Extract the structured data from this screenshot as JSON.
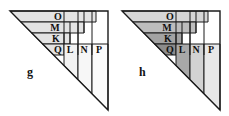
{
  "figure": {
    "title_visible": false,
    "background_color": "#ffffff",
    "stroke_color": "#1a1a1a",
    "panels": [
      {
        "id": "g",
        "panel_label": "g",
        "panel_label_x": 27,
        "panel_label_y": 66,
        "shaded": false,
        "triangle": {
          "apex_left_x": 10,
          "apex_top_y": 11,
          "corner_right_x": 108,
          "corner_bottom_y": 110
        },
        "bands": [
          {
            "label": "O",
            "y_top": 11,
            "y_bottom": 22,
            "x_right": 96,
            "fill": "#e3e3e3",
            "label_x": 58,
            "label_y": 20
          },
          {
            "label": "M",
            "y_top": 22,
            "y_bottom": 33,
            "x_right": 84,
            "fill": "#e3e3e3",
            "label_x": 55,
            "label_y": 31
          },
          {
            "label": "K",
            "y_top": 33,
            "y_bottom": 44,
            "x_right": 70,
            "fill": "#e3e3e3",
            "label_x": 56,
            "label_y": 42
          },
          {
            "label": "Q",
            "y_top": 44,
            "y_bottom": 55,
            "x_right": 64,
            "fill": "#e3e3e3",
            "label_x": 58,
            "label_y": 53
          }
        ],
        "columns": [
          {
            "label": "L",
            "x_left": 64,
            "x_right": 78,
            "fill": "#f2f2f2",
            "label_x": 70,
            "label_y": 53
          },
          {
            "label": "N",
            "x_left": 78,
            "x_right": 92,
            "fill": "#f7f7f7",
            "label_x": 84,
            "label_y": 53
          },
          {
            "label": "P",
            "x_left": 92,
            "x_right": 108,
            "fill": "#fbfbfb",
            "label_x": 99,
            "label_y": 53
          }
        ]
      },
      {
        "id": "h",
        "panel_label": "h",
        "panel_label_x": 27,
        "panel_label_y": 66,
        "shaded": true,
        "triangle": {
          "apex_left_x": 10,
          "apex_top_y": 11,
          "corner_right_x": 108,
          "corner_bottom_y": 110
        },
        "bands": [
          {
            "label": "O",
            "y_top": 11,
            "y_bottom": 22,
            "x_right": 96,
            "fill": "#d6d6d6",
            "label_x": 58,
            "label_y": 20
          },
          {
            "label": "M",
            "y_top": 22,
            "y_bottom": 33,
            "x_right": 84,
            "fill": "#bdbdbd",
            "label_x": 55,
            "label_y": 31
          },
          {
            "label": "K",
            "y_top": 33,
            "y_bottom": 44,
            "x_right": 70,
            "fill": "#a3a3a3",
            "label_x": 56,
            "label_y": 42
          },
          {
            "label": "Q",
            "y_top": 44,
            "y_bottom": 55,
            "x_right": 64,
            "fill": "#8c8c8c",
            "label_x": 58,
            "label_y": 53
          }
        ],
        "columns": [
          {
            "label": "L",
            "x_left": 64,
            "x_right": 78,
            "fill": "#a8a8a8",
            "label_x": 70,
            "label_y": 53
          },
          {
            "label": "N",
            "x_left": 78,
            "x_right": 92,
            "fill": "#d2d2d2",
            "label_x": 84,
            "label_y": 53
          },
          {
            "label": "P",
            "x_left": 92,
            "x_right": 108,
            "fill": "#e8e8e8",
            "label_x": 99,
            "label_y": 53
          }
        ]
      }
    ]
  }
}
